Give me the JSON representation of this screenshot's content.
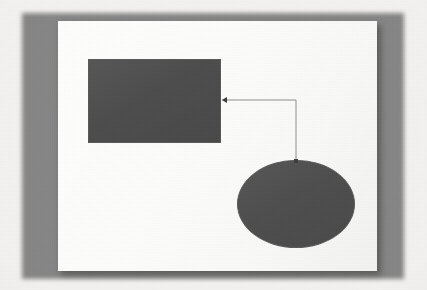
{
  "document": {
    "kind": "flowchart-diagram-photo",
    "title": "",
    "background_color": "#f3f2f0",
    "panel_color": "#868686",
    "page_color": "#fdfdfc"
  },
  "canvas": {
    "width": 319,
    "height": 250,
    "label": ""
  },
  "shapes": [
    {
      "id": "rectangle",
      "type": "rectangle",
      "label": "",
      "fill": "#4d4d4d",
      "stroke": "#5a5a5a",
      "x": 30,
      "y": 38,
      "width": 133,
      "height": 84
    },
    {
      "id": "ellipse",
      "type": "ellipse",
      "label": "",
      "fill": "#4e4e4e",
      "stroke": "#5a5a5a",
      "x": 179,
      "y": 139,
      "width": 118,
      "height": 88
    }
  ],
  "connector": {
    "id": "connector-ellipse-to-rectangle",
    "label": "",
    "stroke": "#8f8f8f",
    "stroke_width": 1,
    "from_shape": "ellipse",
    "to_shape": "rectangle",
    "arrow_head": "at-rectangle",
    "points": [
      {
        "x": 238,
        "y": 140
      },
      {
        "x": 238,
        "y": 79
      },
      {
        "x": 164,
        "y": 79
      }
    ],
    "endpoint_marker": {
      "x": 238,
      "y": 140,
      "size": 4
    },
    "arrow_marker": {
      "x": 164,
      "y": 79,
      "size": 5
    }
  }
}
